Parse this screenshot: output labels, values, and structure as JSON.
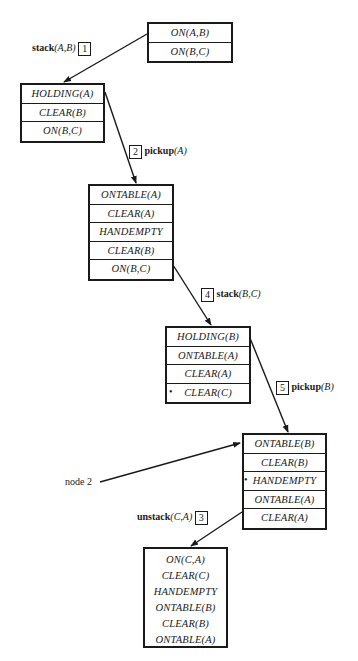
{
  "diagram": {
    "type": "backward-chaining search trace (STRIPS planning)",
    "nodes": [
      {
        "id": "n1",
        "rows": [
          {
            "text": "ON(A,B)"
          },
          {
            "text": "ON(B,C)"
          }
        ]
      },
      {
        "id": "n2",
        "rows": [
          {
            "text": "HOLDING(A)"
          },
          {
            "text": "CLEAR(B)"
          },
          {
            "text": "ON(B,C)"
          }
        ]
      },
      {
        "id": "n3",
        "rows": [
          {
            "text": "ONTABLE(A)"
          },
          {
            "text": "CLEAR(A)"
          },
          {
            "text": "HANDEMPTY"
          },
          {
            "text": "CLEAR(B)"
          },
          {
            "text": "ON(B,C)"
          }
        ]
      },
      {
        "id": "n4",
        "rows": [
          {
            "text": "HOLDING(B)"
          },
          {
            "text": "ONTABLE(A)"
          },
          {
            "text": "CLEAR(A)"
          },
          {
            "text": "CLEAR(C)",
            "marker": "•"
          }
        ]
      },
      {
        "id": "n5",
        "rows": [
          {
            "text": "ONTABLE(B)"
          },
          {
            "text": "CLEAR(B)"
          },
          {
            "text": "HANDEMPTY",
            "marker": "•"
          },
          {
            "text": "ONTABLE(A)"
          },
          {
            "text": "CLEAR(A)"
          }
        ]
      },
      {
        "id": "n6",
        "rows": [
          {
            "text": "ON(C,A)"
          },
          {
            "text": "CLEAR(C)"
          },
          {
            "text": "HANDEMPTY"
          },
          {
            "text": "ONTABLE(B)"
          },
          {
            "text": "CLEAR(B)"
          },
          {
            "text": "ONTABLE(A)"
          }
        ]
      }
    ],
    "edges": [
      {
        "from": "n1",
        "to": "n2",
        "op": "stack",
        "args": "(A,B)",
        "step": "1"
      },
      {
        "from": "n2",
        "to": "n3",
        "op": "pickup",
        "args": "(A)",
        "step": "2"
      },
      {
        "from": "n3",
        "to": "n4",
        "op": "stack",
        "args": "(B,C)",
        "step": "4"
      },
      {
        "from": "n4",
        "to": "n5",
        "op": "pickup",
        "args": "(B)",
        "step": "5"
      },
      {
        "from": "n5",
        "to": "n6",
        "op": "unstack",
        "args": "(C,A)",
        "step": "3"
      }
    ],
    "annotations": [
      {
        "text": "node 2",
        "points_to": "n5"
      }
    ],
    "colors": {
      "ink": "#1a1a1a",
      "background": "#ffffff"
    }
  }
}
